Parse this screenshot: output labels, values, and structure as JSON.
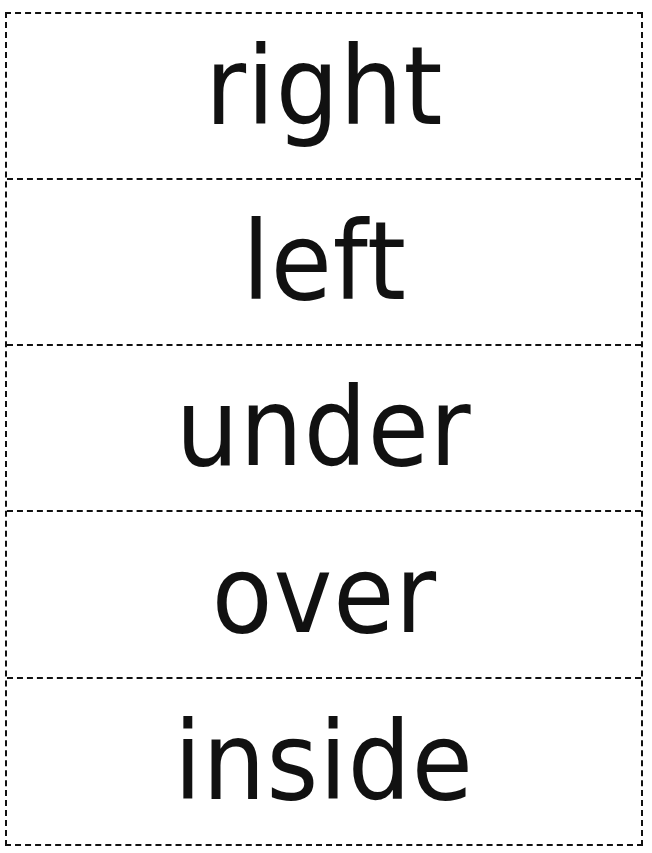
{
  "worksheet": {
    "cards": [
      {
        "word": "right"
      },
      {
        "word": "left"
      },
      {
        "word": "under"
      },
      {
        "word": "over"
      },
      {
        "word": "inside"
      }
    ]
  },
  "style": {
    "ink_color": "#111111",
    "background_color": "#ffffff",
    "border_style": "dashed"
  }
}
